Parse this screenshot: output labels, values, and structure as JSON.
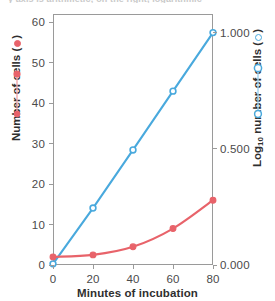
{
  "figure": {
    "top_caption_fragment": "y axis is arithmetic; on the right, logarithmic",
    "colors": {
      "red_series": "#e8636a",
      "blue_series": "#49a9dd",
      "axis": "#9a9a9a",
      "text": "#3b3b3b",
      "background": "#ffffff"
    }
  },
  "chart_data": {
    "type": "line",
    "title": "",
    "xlabel": "Minutes of incubation",
    "x": [
      0,
      20,
      40,
      60,
      80
    ],
    "xlim": [
      0,
      80
    ],
    "xticks": [
      "0",
      "20",
      "40",
      "60",
      "80"
    ],
    "grid": false,
    "legend_position": "axis-labels",
    "axes": [
      {
        "id": "left",
        "label": "Number of cells (",
        "label_suffix": ")",
        "marker": "filled-circle",
        "color": "#e8636a",
        "ylim": [
          0,
          62
        ],
        "yticks": [
          "0",
          "10",
          "20",
          "30",
          "40",
          "50",
          "60"
        ],
        "ytick_values": [
          0,
          10,
          20,
          30,
          40,
          50,
          60
        ]
      },
      {
        "id": "right",
        "label": "Log",
        "label_sub": "10",
        "label_rest": " number of cells (",
        "label_suffix": ")",
        "marker": "open-circle",
        "color": "#49a9dd",
        "ylim": [
          0,
          1.08
        ],
        "yticks": [
          "0.000",
          "0.500",
          "1.000"
        ],
        "ytick_values": [
          0.0,
          0.5,
          1.0
        ]
      }
    ],
    "series": [
      {
        "name": "Number of cells (arithmetic)",
        "axis": "left",
        "color": "#e8636a",
        "marker": "filled-circle",
        "values": [
          2,
          2.5,
          4.5,
          9,
          16
        ]
      },
      {
        "name": "Log10 number of cells",
        "axis": "right",
        "color": "#49a9dd",
        "marker": "open-circle",
        "values": [
          0.005,
          0.245,
          0.495,
          0.748,
          1.0
        ],
        "values_in_left_axis_units": [
          0.3,
          15.0,
          30.2,
          45.6,
          60.8
        ]
      }
    ]
  }
}
